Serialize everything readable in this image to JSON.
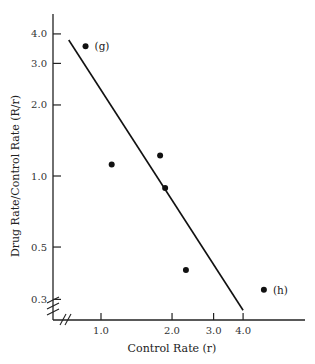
{
  "chart_data": {
    "type": "scatter",
    "title": "",
    "xlabel": "Control Rate (r)",
    "ylabel": "Drug Rate/Control Rate (R/r)",
    "xscale": "log",
    "yscale": "log",
    "xlim": [
      0.7,
      7.0
    ],
    "ylim": [
      0.22,
      4.5
    ],
    "xticks": [
      1.0,
      2.0,
      3.0,
      4.0
    ],
    "xtick_labels": [
      "1.0",
      "2.0",
      "3.0",
      "4.0"
    ],
    "yticks": [
      4.0,
      3.0,
      2.0,
      1.0,
      0.5,
      0.3
    ],
    "ytick_labels": [
      "4.0",
      "3.0",
      "2.0",
      "1.0",
      "0.5",
      "0.3"
    ],
    "grid": false,
    "axis_breaks": true,
    "series": [
      {
        "name": "observations",
        "points": [
          {
            "x": 0.86,
            "y": 3.55,
            "label": "(g)"
          },
          {
            "x": 1.11,
            "y": 1.12,
            "label": ""
          },
          {
            "x": 1.78,
            "y": 1.22,
            "label": ""
          },
          {
            "x": 1.87,
            "y": 0.89,
            "label": ""
          },
          {
            "x": 2.29,
            "y": 0.4,
            "label": ""
          },
          {
            "x": 4.9,
            "y": 0.33,
            "label": "(h)"
          }
        ]
      }
    ],
    "fit_line": {
      "x": [
        0.73,
        4.0
      ],
      "y": [
        3.77,
        0.27
      ]
    }
  }
}
